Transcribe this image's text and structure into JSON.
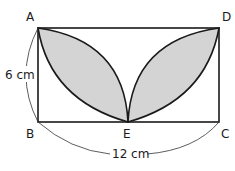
{
  "diagram": {
    "vertices": {
      "A": {
        "label": "A"
      },
      "B": {
        "label": "B"
      },
      "C": {
        "label": "C"
      },
      "D": {
        "label": "D"
      },
      "E": {
        "label": "E"
      }
    },
    "dimensions": {
      "height": "6 cm",
      "width": "12 cm"
    },
    "colors": {
      "stroke": "#1a1a1a",
      "shaded": "#d4d4d4",
      "background": "#ffffff"
    }
  }
}
